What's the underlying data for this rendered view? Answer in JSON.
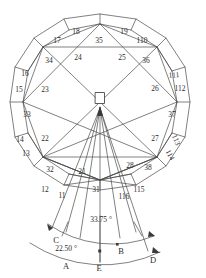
{
  "figure": {
    "stroke_color": "#4a4a4a",
    "text_color": "#2b2b2b",
    "background": "#ffffff",
    "face_labels": [
      {
        "id": "11",
        "text": "11",
        "x": 62,
        "y": 196
      },
      {
        "id": "12",
        "text": "12",
        "x": 45,
        "y": 190
      },
      {
        "id": "13",
        "text": "13",
        "x": 26,
        "y": 154
      },
      {
        "id": "14",
        "text": "14",
        "x": 20,
        "y": 140
      },
      {
        "id": "15",
        "text": "15",
        "x": 19,
        "y": 90
      },
      {
        "id": "16",
        "text": "16",
        "x": 25,
        "y": 74
      },
      {
        "id": "17",
        "text": "17",
        "x": 57,
        "y": 41
      },
      {
        "id": "18",
        "text": "18",
        "x": 76,
        "y": 32
      },
      {
        "id": "19",
        "text": "19",
        "x": 124,
        "y": 32
      },
      {
        "id": "110",
        "text": "110",
        "x": 142,
        "y": 41
      },
      {
        "id": "111",
        "text": "111",
        "x": 174,
        "y": 75
      },
      {
        "id": "112",
        "text": "112",
        "x": 180,
        "y": 89
      },
      {
        "id": "113",
        "text": "113",
        "x": 176,
        "y": 140
      },
      {
        "id": "114",
        "text": "114",
        "x": 170,
        "y": 155
      },
      {
        "id": "115",
        "text": "115",
        "x": 139,
        "y": 190
      },
      {
        "id": "116",
        "text": "116",
        "x": 124,
        "y": 197
      },
      {
        "id": "21",
        "text": "21",
        "x": 82,
        "y": 172
      },
      {
        "id": "22",
        "text": "22",
        "x": 45,
        "y": 139
      },
      {
        "id": "23",
        "text": "23",
        "x": 45,
        "y": 90
      },
      {
        "id": "24",
        "text": "24",
        "x": 78,
        "y": 58
      },
      {
        "id": "25",
        "text": "25",
        "x": 122,
        "y": 58
      },
      {
        "id": "26",
        "text": "26",
        "x": 155,
        "y": 89
      },
      {
        "id": "27",
        "text": "27",
        "x": 155,
        "y": 139
      },
      {
        "id": "28",
        "text": "28",
        "x": 130,
        "y": 166
      },
      {
        "id": "31",
        "text": "31",
        "x": 96,
        "y": 190
      },
      {
        "id": "32",
        "text": "32",
        "x": 50,
        "y": 170
      },
      {
        "id": "33",
        "text": "33",
        "x": 27,
        "y": 115
      },
      {
        "id": "34",
        "text": "34",
        "x": 49,
        "y": 61
      },
      {
        "id": "35",
        "text": "35",
        "x": 99,
        "y": 41
      },
      {
        "id": "36",
        "text": "36",
        "x": 146,
        "y": 61
      },
      {
        "id": "37",
        "text": "37",
        "x": 172,
        "y": 115
      },
      {
        "id": "38",
        "text": "38",
        "x": 148,
        "y": 168
      }
    ],
    "point_labels": [
      {
        "id": "A",
        "text": "A",
        "x": 66,
        "y": 266
      },
      {
        "id": "B",
        "text": "B",
        "x": 121,
        "y": 251
      },
      {
        "id": "C",
        "text": "C",
        "x": 56,
        "y": 240
      },
      {
        "id": "D",
        "text": "D",
        "x": 153,
        "y": 260
      },
      {
        "id": "E",
        "text": "E",
        "x": 99,
        "y": 268
      }
    ],
    "angle_labels": [
      {
        "id": "inner-angle",
        "text": "33.75 °",
        "x": 101,
        "y": 220
      },
      {
        "id": "outer-angle",
        "text": "22.50 °",
        "x": 66,
        "y": 249
      }
    ],
    "center_marker": {
      "name": "center-square",
      "x": 100,
      "y": 98,
      "w": 9,
      "h": 11
    }
  }
}
